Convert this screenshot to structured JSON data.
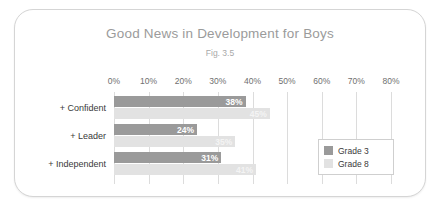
{
  "chart_data": {
    "type": "bar",
    "orientation": "horizontal",
    "title": "Good News in Development for Boys",
    "subtitle": "Fig. 3.5",
    "xlabel": "",
    "ylabel": "",
    "categories": [
      "+ Confident",
      "+ Leader",
      "+ Independent"
    ],
    "series": [
      {
        "name": "Grade 3",
        "color": "#9a9a9a",
        "values": [
          38,
          24,
          31
        ],
        "labels": [
          "38%",
          "24%",
          "31%"
        ]
      },
      {
        "name": "Grade 8",
        "color": "#e2e2e2",
        "values": [
          45,
          35,
          41
        ],
        "labels": [
          "45%",
          "35%",
          "41%"
        ]
      }
    ],
    "xlim": [
      0,
      80
    ],
    "xticks": [
      0,
      10,
      20,
      30,
      40,
      50,
      60,
      70,
      80
    ],
    "xticklabels": [
      "0%",
      "10%",
      "20%",
      "30%",
      "40%",
      "50%",
      "60%",
      "70%",
      "80%"
    ],
    "grid": true,
    "legend_position": "right-inside"
  }
}
